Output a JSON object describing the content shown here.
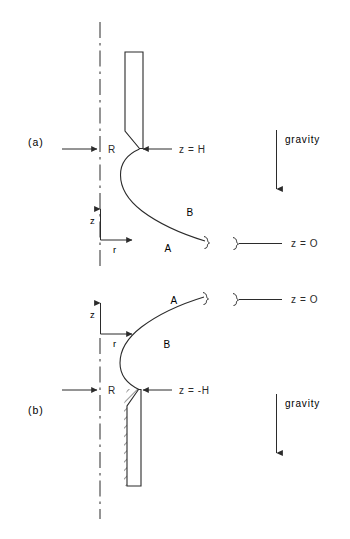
{
  "figure": {
    "type": "scientific-diagram",
    "background_color": "#ffffff",
    "ink_color": "#2b2b2b",
    "width": 350,
    "height": 539
  },
  "panels": [
    {
      "id": "a",
      "label": "(a)",
      "orientation": "nozzle-pointing-down",
      "labels": {
        "radius": "R",
        "axis_z": "z",
        "axis_r": "r",
        "region_upper": "B",
        "region_lower": "A",
        "interface_level": "z = H",
        "reference_level": "z = O",
        "gravity": "gravity"
      }
    },
    {
      "id": "b",
      "label": "(b)",
      "orientation": "nozzle-pointing-up",
      "labels": {
        "radius": "R",
        "axis_z": "z",
        "axis_r": "r",
        "region_upper": "A",
        "region_lower": "B",
        "interface_level": "z = -H",
        "reference_level": "z = O",
        "gravity": "gravity"
      }
    }
  ]
}
